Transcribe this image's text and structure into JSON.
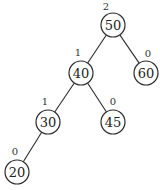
{
  "diagram": {
    "type": "binary-search-tree",
    "colors": {
      "stroke": "#2a2a2a",
      "background": "#ffffff",
      "text": "#222222"
    },
    "nodes": [
      {
        "id": "n50",
        "value": "50",
        "height": "2",
        "cx": 113,
        "cy": 25,
        "hx": 106,
        "hy": 6
      },
      {
        "id": "n40",
        "value": "40",
        "height": "1",
        "cx": 81,
        "cy": 73,
        "hx": 78,
        "hy": 52
      },
      {
        "id": "n60",
        "value": "60",
        "height": "0",
        "cx": 146,
        "cy": 73,
        "hx": 148,
        "hy": 53
      },
      {
        "id": "n30",
        "value": "30",
        "height": "1",
        "cx": 48,
        "cy": 122,
        "hx": 45,
        "hy": 101
      },
      {
        "id": "n45",
        "value": "45",
        "height": "0",
        "cx": 113,
        "cy": 122,
        "hx": 113,
        "hy": 101
      },
      {
        "id": "n20",
        "value": "20",
        "height": "0",
        "cx": 17,
        "cy": 172,
        "hx": 15,
        "hy": 151
      }
    ],
    "edges": [
      {
        "from": "n50",
        "to": "n40"
      },
      {
        "from": "n50",
        "to": "n60"
      },
      {
        "from": "n40",
        "to": "n30"
      },
      {
        "from": "n40",
        "to": "n45"
      },
      {
        "from": "n30",
        "to": "n20"
      }
    ],
    "radius": 12
  }
}
